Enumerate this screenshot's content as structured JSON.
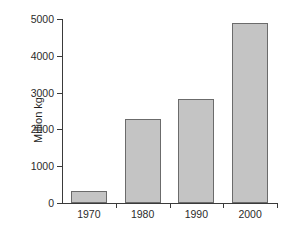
{
  "chart_data": {
    "type": "bar",
    "title": "",
    "subtitle": "",
    "xlabel": "",
    "ylabel": "Million kg",
    "categories": [
      "1970",
      "1980",
      "1990",
      "2000"
    ],
    "values": [
      330,
      2290,
      2840,
      4900
    ],
    "series": [
      {
        "name": "Million kg",
        "values": [
          330,
          2290,
          2840,
          4900
        ]
      }
    ],
    "ylim": [
      0,
      5000
    ],
    "ytick_labels": [
      "0",
      "1000",
      "2000",
      "3000",
      "4000",
      "5000"
    ],
    "ytick_values": [
      0,
      1000,
      2000,
      3000,
      4000,
      5000
    ],
    "xtick_labels": [
      "1970",
      "1980",
      "1990",
      "2000"
    ],
    "grid": false,
    "legend": false,
    "legend_position": "none",
    "colors": {
      "bar_fill": "#c4c4c4",
      "bar_border": "#6b6b6b",
      "axis": "#3a3a3a",
      "text": "#2b2b2b",
      "background": "#ffffff"
    }
  }
}
